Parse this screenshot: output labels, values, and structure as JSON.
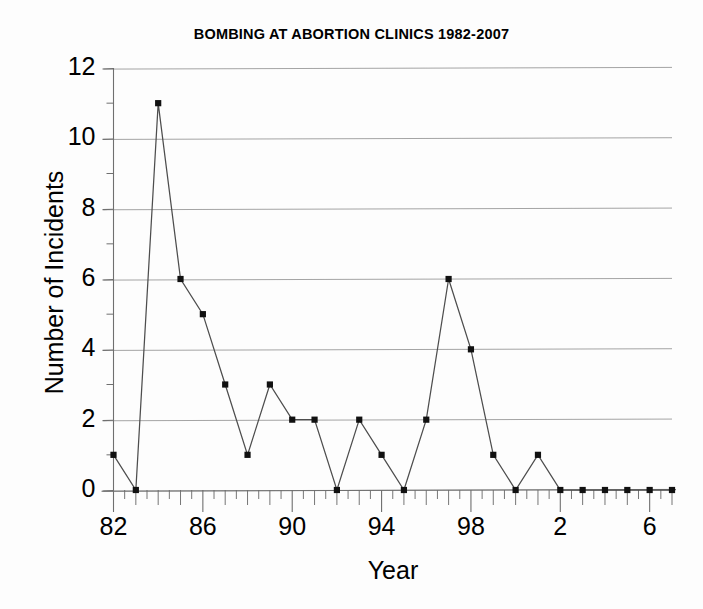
{
  "chart_data": {
    "type": "line",
    "title": "BOMBING AT ABORTION CLINICS 1982-2007",
    "xlabel": "Year",
    "ylabel": "Number of Incidents",
    "x": [
      1982,
      1983,
      1984,
      1985,
      1986,
      1987,
      1988,
      1989,
      1990,
      1991,
      1992,
      1993,
      1994,
      1995,
      1996,
      1997,
      1998,
      1999,
      2000,
      2001,
      2002,
      2003,
      2004,
      2005,
      2006,
      2007
    ],
    "values": [
      1,
      0,
      11,
      6,
      5,
      3,
      1,
      3,
      2,
      2,
      0,
      2,
      1,
      0,
      2,
      6,
      4,
      1,
      0,
      1,
      0,
      0,
      0,
      0,
      0,
      0
    ],
    "series": [
      {
        "name": "Number of Incidents",
        "values": [
          1,
          0,
          11,
          6,
          5,
          3,
          1,
          3,
          2,
          2,
          0,
          2,
          1,
          0,
          2,
          6,
          4,
          1,
          0,
          1,
          0,
          0,
          0,
          0,
          0,
          0
        ]
      }
    ],
    "xlim": [
      1982,
      2007
    ],
    "ylim": [
      0,
      12
    ],
    "ytick_values": [
      0,
      2,
      4,
      6,
      8,
      10,
      12
    ],
    "ytick_labels": [
      "0",
      "2",
      "4",
      "6",
      "8",
      "10",
      "12"
    ],
    "yminor_values": [
      1,
      3,
      5,
      7,
      9,
      11
    ],
    "xtick_values": [
      1982,
      1986,
      1990,
      1994,
      1998,
      2002,
      2006
    ],
    "xtick_labels": [
      "82",
      "86",
      "90",
      "94",
      "98",
      "2",
      "6"
    ],
    "grid": true,
    "grid_axis": "y",
    "legend": false,
    "marker": "square",
    "line_color": "#4d4d4d",
    "marker_color": "#111111",
    "grid_color": "#9a9a9a",
    "axis_color": "#6f6f6f",
    "background": "#fdfdfd"
  },
  "figure": {
    "title": "BOMBING AT ABORTION CLINICS 1982-2007",
    "x_axis_title": "Year",
    "y_axis_title": "Number of Incidents"
  }
}
